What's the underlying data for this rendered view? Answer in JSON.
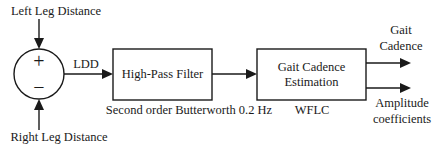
{
  "diagram": {
    "type": "block-diagram",
    "inputs": {
      "top": "Left Leg Distance",
      "bottom": "Right Leg Distance"
    },
    "summing_junction": {
      "top_sign": "+",
      "bottom_sign": "−"
    },
    "signals": {
      "ldd": "LDD"
    },
    "blocks": [
      {
        "id": "high-pass-filter",
        "label_lines": [
          "High-Pass Filter"
        ],
        "caption": "Second order Butterworth 0.2 Hz"
      },
      {
        "id": "gait-cadence-estimation",
        "label_lines": [
          "Gait Cadence",
          "Estimation"
        ],
        "caption": "WFLC"
      }
    ],
    "outputs": [
      {
        "id": "gait-cadence",
        "label_lines": [
          "Gait",
          "Cadence"
        ]
      },
      {
        "id": "amplitude-coefficients",
        "label_lines": [
          "Amplitude",
          "coefficients"
        ]
      }
    ],
    "colors": {
      "stroke": "#1a1a1a",
      "background": "#ffffff"
    }
  }
}
